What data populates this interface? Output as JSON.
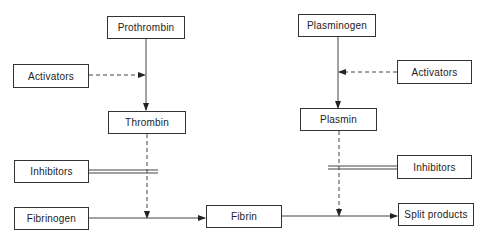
{
  "diagram": {
    "nodes": {
      "prothrombin": "Prothrombin",
      "activators_left": "Activators",
      "thrombin": "Thrombin",
      "inhibitors_left": "Inhibitors",
      "fibrinogen": "Fibrinogen",
      "fibrin": "Fibrin",
      "plasminogen": "Plasminogen",
      "activators_right": "Activators",
      "plasmin": "Plasmin",
      "inhibitors_right": "Inhibitors",
      "split_products": "Split products"
    },
    "edges": [
      {
        "from": "prothrombin",
        "to": "thrombin",
        "style": "solid"
      },
      {
        "from": "activators_left",
        "to": "prothrombin-thrombin",
        "style": "dashed"
      },
      {
        "from": "thrombin",
        "to": "fibrinogen-fibrin",
        "style": "dashed"
      },
      {
        "from": "inhibitors_left",
        "to": "thrombin-fibrin",
        "style": "double-line"
      },
      {
        "from": "fibrinogen",
        "to": "fibrin",
        "style": "solid"
      },
      {
        "from": "plasminogen",
        "to": "plasmin",
        "style": "solid"
      },
      {
        "from": "activators_right",
        "to": "plasminogen-plasmin",
        "style": "dashed"
      },
      {
        "from": "plasmin",
        "to": "fibrin-split_products",
        "style": "dashed"
      },
      {
        "from": "inhibitors_right",
        "to": "plasmin-split",
        "style": "double-line"
      },
      {
        "from": "fibrin",
        "to": "split_products",
        "style": "solid"
      }
    ]
  }
}
